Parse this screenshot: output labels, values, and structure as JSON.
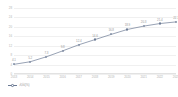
{
  "chart_data": {
    "type": "line",
    "title": "",
    "xlabel": "",
    "ylabel": "",
    "grid": true,
    "legend_position": "bottom-left",
    "categories": [
      "2013",
      "2014",
      "2015",
      "2016",
      "2017",
      "2018",
      "2019",
      "2020",
      "2021",
      "2022",
      "2023"
    ],
    "series": [
      {
        "name": "占比(%)",
        "values": [
          4.1,
          5.2,
          7.3,
          9.8,
          12.4,
          14.6,
          16.8,
          18.9,
          20.3,
          21.4,
          22.1
        ]
      }
    ],
    "point_labels": [
      "4.1",
      "5.2",
      "7.3",
      "9.8",
      "12.4",
      "14.6",
      "16.8",
      "18.9",
      "20.3",
      "21.4",
      "22.1"
    ],
    "ylim": [
      0,
      28
    ],
    "yticks": [
      "0",
      "4",
      "8",
      "12",
      "16",
      "20",
      "24",
      "28"
    ],
    "colors": {
      "line": "#6b7a94",
      "marker_fill": "#ffffff",
      "marker_stroke": "#6b7a94",
      "grid": "#f0f0f0",
      "axis": "#e2e2e2",
      "tick_text": "#b4b4b4",
      "label_text": "#9a9a9a",
      "background": "#ffffff"
    }
  },
  "legend": {
    "items": [
      {
        "label": "占比(%)",
        "marker": "line-dot-marker"
      }
    ]
  }
}
